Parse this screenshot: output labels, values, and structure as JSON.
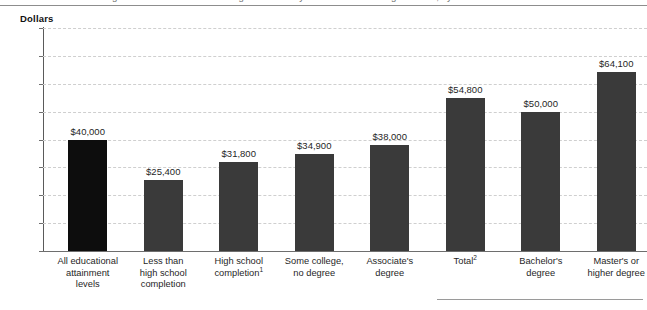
{
  "header": {
    "title_clipped": "Figure 1. Median annual earnings of full-time year-round workers ages 25–34, by educational attainment: 2018",
    "axis_unit_label": "Dollars"
  },
  "chart_data": {
    "type": "bar",
    "title": "",
    "xlabel": "",
    "ylabel": "Dollars",
    "ylim": [
      0,
      80000
    ],
    "ytick_values": [
      80000,
      70000,
      60000,
      50000,
      40000,
      30000,
      20000,
      10000,
      0
    ],
    "ytick_labels": [
      "$80,000",
      "70,000",
      "60,000",
      "50,000",
      "40,000",
      "30,000",
      "20,000",
      "10,000",
      "0"
    ],
    "grid": true,
    "legend": "none",
    "categories": [
      "All educational attainment levels",
      "Less than high school completion",
      "High school completion",
      "Some college, no degree",
      "Associate's degree",
      "Total",
      "Bachelor's degree",
      "Master's or higher degree"
    ],
    "category_lines": [
      [
        "All educational",
        "attainment",
        "levels"
      ],
      [
        "Less than",
        "high school",
        "completion"
      ],
      [
        "High school",
        "completion",
        ""
      ],
      [
        "Some college,",
        "no degree",
        ""
      ],
      [
        "Associate's",
        "degree",
        ""
      ],
      [
        "Total",
        "",
        ""
      ],
      [
        "Bachelor's",
        "degree",
        ""
      ],
      [
        "Master's or",
        "higher degree",
        ""
      ]
    ],
    "category_footnote_markers": [
      "",
      "",
      "1",
      "",
      "",
      "2",
      "",
      ""
    ],
    "values": [
      40000,
      25400,
      31800,
      34900,
      38000,
      54800,
      50000,
      64100
    ],
    "value_labels": [
      "$40,000",
      "$25,400",
      "$31,800",
      "$34,900",
      "$38,000",
      "$54,800",
      "$50,000",
      "$64,100"
    ],
    "bar_colors": [
      "#0d0d0d",
      "#3a3a3a",
      "#3a3a3a",
      "#3a3a3a",
      "#3a3a3a",
      "#3a3a3a",
      "#3a3a3a",
      "#3a3a3a"
    ]
  }
}
